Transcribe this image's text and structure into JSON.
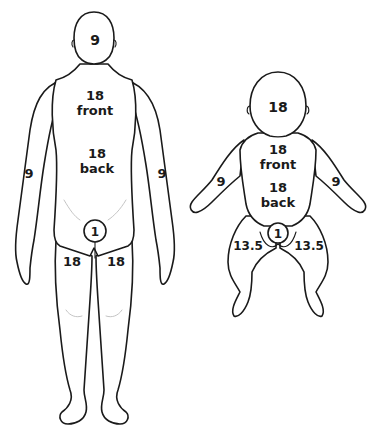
{
  "diagram": {
    "figures": [
      {
        "id": "adult",
        "labels": {
          "head": "9",
          "torso_front_value": "18",
          "torso_front_text": "front",
          "torso_back_value": "18",
          "torso_back_text": "back",
          "left_arm": "9",
          "right_arm": "9",
          "perineum": "1",
          "left_leg": "18",
          "right_leg": "18"
        }
      },
      {
        "id": "infant",
        "labels": {
          "head": "18",
          "torso_front_value": "18",
          "torso_front_text": "front",
          "torso_back_value": "18",
          "torso_back_text": "back",
          "left_arm": "9",
          "right_arm": "9",
          "perineum": "1",
          "left_leg": "13.5",
          "right_leg": "13.5"
        }
      }
    ],
    "colors": {
      "line": "#1a1a1a",
      "background": "#ffffff"
    }
  }
}
